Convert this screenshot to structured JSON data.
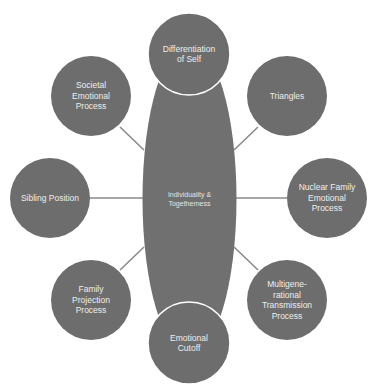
{
  "diagram": {
    "colors": {
      "node_fill": "#6d6d6d",
      "center_fill": "#707070",
      "connector": "#8a8a8a",
      "outline": "#ffffff",
      "text": "#eeeeee"
    },
    "center": {
      "label": "Individuality &\nTogetherness",
      "cx": 189.5,
      "cy": 199,
      "rx": 47,
      "ry": 156
    },
    "nodes": [
      {
        "id": "differentiation-of-self",
        "label": "Differentiation\nof Self",
        "cx": 189,
        "cy": 54,
        "r": 41,
        "outlined": true
      },
      {
        "id": "triangles",
        "label": "Triangles",
        "cx": 287,
        "cy": 96,
        "r": 40,
        "outlined": false
      },
      {
        "id": "nuclear-family-emotional-process",
        "label": "Nuclear Family\nEmotional\nProcess",
        "cx": 327,
        "cy": 198,
        "r": 40,
        "outlined": false
      },
      {
        "id": "multigenerational-transmission-process",
        "label": "Multigene-\nrational\nTransmission\nProcess",
        "cx": 287,
        "cy": 300,
        "r": 40,
        "outlined": false
      },
      {
        "id": "emotional-cutoff",
        "label": "Emotional\nCutoff",
        "cx": 189,
        "cy": 343,
        "r": 41,
        "outlined": true
      },
      {
        "id": "family-projection-process",
        "label": "Family\nProjection\nProcess",
        "cx": 91,
        "cy": 300,
        "r": 40,
        "outlined": false
      },
      {
        "id": "sibling-position",
        "label": "Sibling Position",
        "cx": 50,
        "cy": 198,
        "r": 40,
        "outlined": false
      },
      {
        "id": "societal-emotional-process",
        "label": "Societal\nEmotional\nProcess",
        "cx": 91,
        "cy": 96,
        "r": 40,
        "outlined": false
      }
    ],
    "connectors": [
      {
        "id": "to-triangles",
        "x1": 234,
        "y1": 150,
        "x2": 258,
        "y2": 127
      },
      {
        "id": "to-nuclear-family",
        "x1": 236,
        "y1": 198,
        "x2": 287,
        "y2": 198
      },
      {
        "id": "to-multigenerational",
        "x1": 234,
        "y1": 247,
        "x2": 258,
        "y2": 270
      },
      {
        "id": "to-family-projection",
        "x1": 144,
        "y1": 247,
        "x2": 120,
        "y2": 270
      },
      {
        "id": "to-sibling-position",
        "x1": 90,
        "y1": 198,
        "x2": 143,
        "y2": 198
      },
      {
        "id": "to-societal",
        "x1": 144,
        "y1": 150,
        "x2": 120,
        "y2": 127
      }
    ]
  }
}
